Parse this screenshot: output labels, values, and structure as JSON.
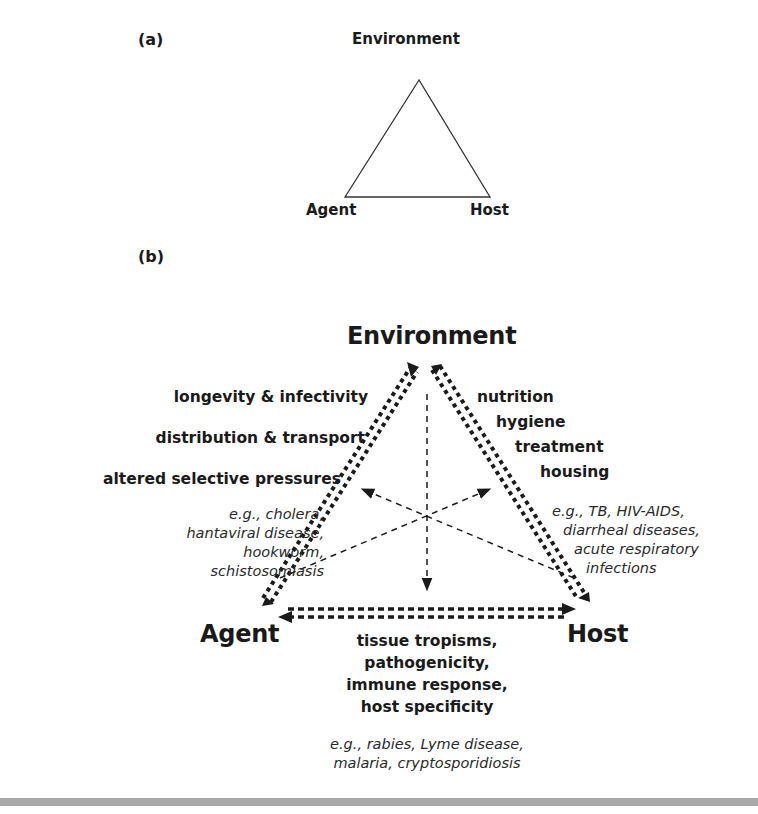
{
  "panel_a": {
    "label": "(a)",
    "nodes": {
      "top": "Environment",
      "left": "Agent",
      "right": "Host"
    }
  },
  "panel_b": {
    "label": "(b)",
    "nodes": {
      "top": "Environment",
      "left": "Agent",
      "right": "Host"
    },
    "agent_environment": {
      "factors": [
        "longevity & infectivity",
        "distribution & transport",
        "altered selective pressures"
      ],
      "examples": [
        "e.g., cholera,",
        "hantaviral disease,",
        "hookworm,",
        "schistosomiasis"
      ]
    },
    "host_environment": {
      "factors": [
        "nutrition",
        "hygiene",
        "treatment",
        "housing"
      ],
      "examples": [
        "e.g., TB, HIV-AIDS,",
        "diarrheal diseases,",
        "acute respiratory",
        "infections"
      ]
    },
    "agent_host": {
      "factors": [
        "tissue tropisms,",
        "pathogenicity,",
        "immune response,",
        "host specificity"
      ],
      "examples": [
        "e.g., rabies, Lyme disease,",
        "malaria, cryptosporidiosis"
      ]
    }
  },
  "colors": {
    "ink": "#1a1a1a",
    "rule": "#a9a9a9"
  }
}
